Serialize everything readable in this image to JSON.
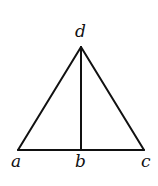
{
  "diagram": {
    "type": "triangle-with-altitude",
    "points": [
      {
        "id": "a",
        "label": "a",
        "x": 18,
        "y": 150,
        "label_x": 11,
        "label_y": 167
      },
      {
        "id": "b",
        "label": "b",
        "x": 81,
        "y": 150,
        "label_x": 75,
        "label_y": 167
      },
      {
        "id": "c",
        "label": "c",
        "x": 144,
        "y": 150,
        "label_x": 141,
        "label_y": 167
      },
      {
        "id": "d",
        "label": "d",
        "x": 81,
        "y": 47,
        "label_x": 75,
        "label_y": 37
      }
    ],
    "segments": [
      {
        "from": "a",
        "to": "d"
      },
      {
        "from": "d",
        "to": "c"
      },
      {
        "from": "a",
        "to": "c"
      },
      {
        "from": "d",
        "to": "b"
      }
    ],
    "colors": {
      "stroke": "#111111",
      "background": "#ffffff"
    }
  }
}
